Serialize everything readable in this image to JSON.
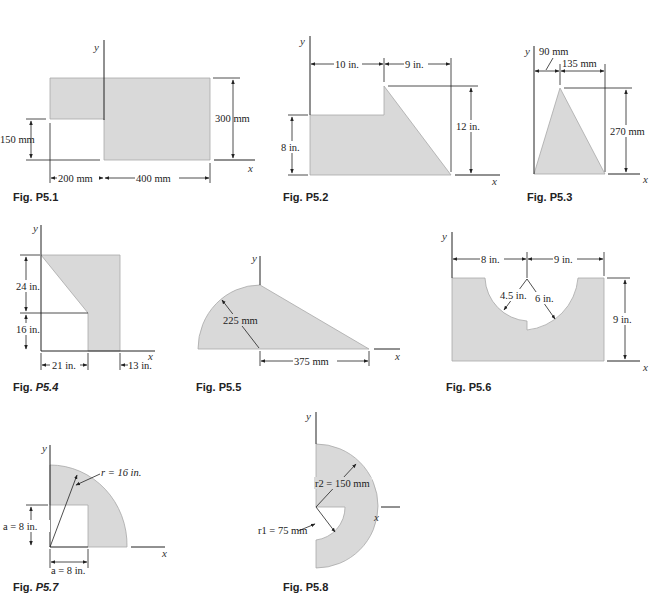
{
  "page": {
    "background": "#ffffff",
    "shape_fill": "#d9d9d9"
  },
  "axes": {
    "x": "x",
    "y": "y"
  },
  "figures": [
    {
      "id": "P5.1",
      "caption_prefix": "Fig.",
      "caption_num": "P5.1",
      "dims": {
        "height": "300 mm",
        "notch_height": "150 mm",
        "left_width": "200 mm",
        "right_width": "400 mm"
      }
    },
    {
      "id": "P5.2",
      "caption_prefix": "Fig.",
      "caption_num": "P5.2",
      "dims": {
        "left_width": "10 in.",
        "right_width": "9 in.",
        "total_height": "12 in.",
        "left_height": "8 in."
      }
    },
    {
      "id": "P5.3",
      "caption_prefix": "Fig.",
      "caption_num": "P5.3",
      "dims": {
        "apex_offset": "90 mm",
        "right_width": "135 mm",
        "height": "270 mm"
      }
    },
    {
      "id": "P5.4",
      "caption_prefix": "Fig.",
      "caption_num": "P5.4",
      "dims": {
        "upper_height": "24 in.",
        "lower_height": "16 in.",
        "left_width": "21 in.",
        "right_width": "13 in."
      }
    },
    {
      "id": "P5.5",
      "caption_prefix": "Fig.",
      "caption_num": "P5.5",
      "dims": {
        "radius": "225 mm",
        "triangle_base": "375 mm"
      }
    },
    {
      "id": "P5.6",
      "caption_prefix": "Fig.",
      "caption_num": "P5.6",
      "dims": {
        "left_width": "8 in.",
        "right_width": "9 in.",
        "small_radius": "4.5 in.",
        "large_radius": "6 in.",
        "height": "9 in."
      }
    },
    {
      "id": "P5.7",
      "caption_prefix": "Fig.",
      "caption_num": "P5.7",
      "dims": {
        "radius": "r = 16 in.",
        "a_vertical": "a = 8 in.",
        "a_horizontal": "a = 8 in."
      }
    },
    {
      "id": "P5.8",
      "caption_prefix": "Fig.",
      "caption_num": "P5.8",
      "dims": {
        "r2": "r2 = 150 mm",
        "r1": "r1 = 75 mm"
      }
    }
  ]
}
